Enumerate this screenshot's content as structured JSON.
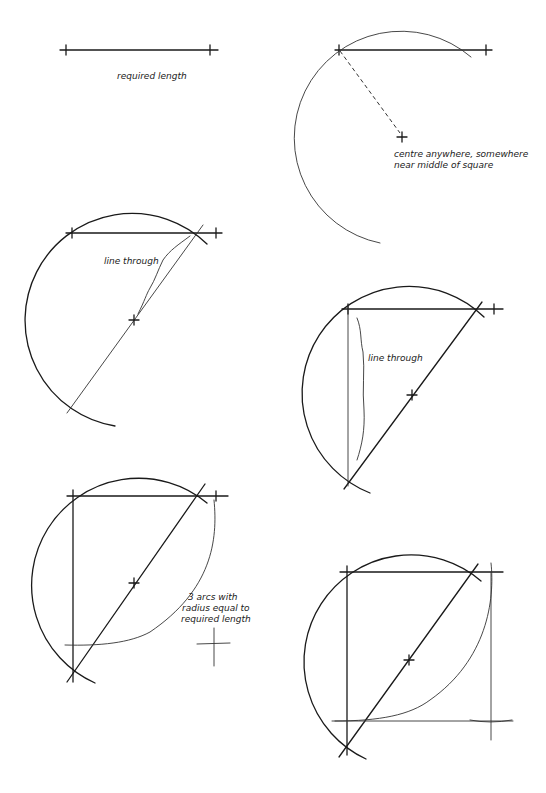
{
  "steps": [
    {
      "id": 1,
      "label": "required length"
    },
    {
      "id": 2,
      "label_line1": "centre anywhere, somewhere",
      "label_line2": "near middle of square"
    },
    {
      "id": 3,
      "label": "line through"
    },
    {
      "id": 4,
      "label": "line through"
    },
    {
      "id": 5,
      "label_line1": "3 arcs with",
      "label_line2": "radius equal to",
      "label_line3": "required length"
    },
    {
      "id": 6
    }
  ],
  "colors": {
    "ink": "#1a1a1a",
    "background": "#ffffff"
  }
}
